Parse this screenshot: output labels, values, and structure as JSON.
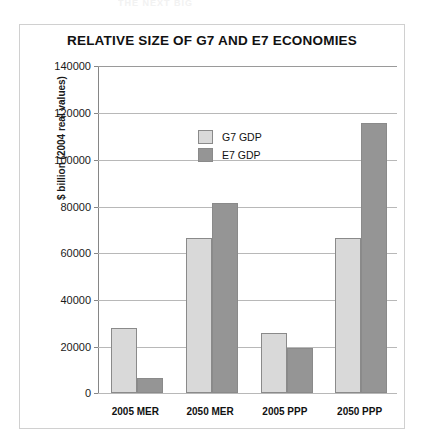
{
  "scan_artifact": {
    "text": "THE NEXT BIG"
  },
  "chart_data": {
    "type": "bar",
    "title": "RELATIVE SIZE OF G7 AND E7 ECONOMIES",
    "xlabel": "",
    "ylabel": "$ billion (2004 real values)",
    "categories": [
      "2005 MER",
      "2050 MER",
      "2005 PPP",
      "2050 PPP"
    ],
    "series": [
      {
        "name": "G7 GDP",
        "color": "#d9d9d9",
        "values": [
          28000,
          66500,
          25500,
          66500
        ]
      },
      {
        "name": "E7 GDP",
        "color": "#959595",
        "values": [
          6400,
          81500,
          19300,
          115800
        ]
      }
    ],
    "ylim": [
      0,
      140000
    ],
    "yticks": [
      0,
      20000,
      40000,
      60000,
      80000,
      100000,
      120000,
      140000
    ],
    "ytick_labels": [
      "0",
      "20000",
      "40000",
      "60000",
      "80000",
      "100000",
      "120000",
      "140000"
    ],
    "grid": true,
    "legend_position": "inside-upper-left"
  }
}
